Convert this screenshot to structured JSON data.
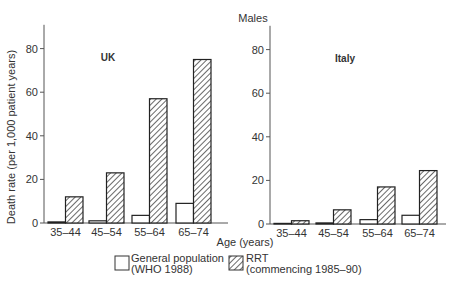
{
  "title": "Males",
  "ylabel": "Death rate (per 1,000 patient years)",
  "xlabel": "Age (years)",
  "legend": {
    "general_line1": "General population",
    "general_line2": "(WHO 1988)",
    "rrt_line1": "RRT",
    "rrt_line2": "(commencing 1985–90)"
  },
  "panels": [
    {
      "label": "UK"
    },
    {
      "label": "Italy"
    }
  ],
  "chart_data": [
    {
      "type": "bar",
      "title": "UK",
      "subtitle": "Males",
      "xlabel": "Age (years)",
      "ylabel": "Death rate (per 1,000 patient years)",
      "categories": [
        "35–44",
        "45–54",
        "55–64",
        "65–74"
      ],
      "series": [
        {
          "name": "General population (WHO 1988)",
          "values": [
            0.5,
            1,
            3.5,
            9
          ]
        },
        {
          "name": "RRT (commencing 1985–90)",
          "values": [
            12,
            23,
            57,
            75
          ]
        }
      ],
      "ylim": [
        0,
        90
      ],
      "yticks": [
        0,
        20,
        40,
        60,
        80
      ],
      "grid": false,
      "legend_position": "bottom"
    },
    {
      "type": "bar",
      "title": "Italy",
      "subtitle": "Males",
      "xlabel": "Age (years)",
      "ylabel": "",
      "categories": [
        "35–44",
        "45–54",
        "55–64",
        "65–74"
      ],
      "series": [
        {
          "name": "General population (WHO 1988)",
          "values": [
            0,
            0.5,
            2,
            4
          ]
        },
        {
          "name": "RRT (commencing 1985–90)",
          "values": [
            1.5,
            6.5,
            17,
            24.5
          ]
        }
      ],
      "ylim": [
        0,
        90
      ],
      "yticks": [
        0,
        20,
        40,
        60,
        80
      ],
      "grid": false,
      "legend_position": "bottom"
    }
  ]
}
